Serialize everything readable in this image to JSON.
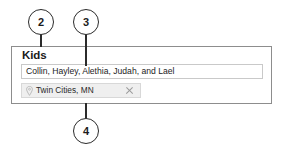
{
  "callouts": [
    {
      "number": "2",
      "target": "panel-heading"
    },
    {
      "number": "3",
      "target": "names-field"
    },
    {
      "number": "4",
      "target": "location-field"
    }
  ],
  "panel": {
    "heading": "Kids",
    "names_field": {
      "value": "Collin, Hayley, Alethia, Judah, and Lael",
      "placeholder": "Names"
    },
    "location_field": {
      "icon": "map-pin-icon",
      "value": "Twin Cities, MN",
      "placeholder": "Location",
      "clear_icon": "close-icon"
    }
  },
  "colors": {
    "panel_border": "#8d8d8d",
    "input_border": "#c9c9c9",
    "chip_background": "#efefef",
    "callout_stroke": "#2b2b2b",
    "text": "#1d1d1d"
  }
}
